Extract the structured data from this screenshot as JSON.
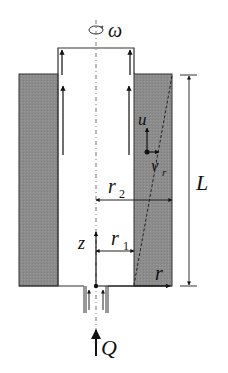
{
  "diagram": {
    "type": "schematic",
    "colors": {
      "wall_fill": "#8c8c8c",
      "line": "#222222",
      "background": "#ffffff"
    },
    "labels": {
      "omega": "ω",
      "u": "u",
      "v": "v",
      "v_sub": "r",
      "r2": "r",
      "r2_sub": "2",
      "r1": "r",
      "r1_sub": "1",
      "z": "z",
      "r_axis": "r",
      "L": "L",
      "Q": "Q"
    },
    "elements": [
      "rotation-indicator",
      "rotating-inner-cylinder",
      "left-outer-wall",
      "right-outer-wall",
      "centerline-axis",
      "axial-flow-arrows",
      "velocity-vectors-u-vr",
      "radius-r1-dimension",
      "radius-r2-dimension",
      "length-L-dimension",
      "z-axis",
      "r-axis",
      "inlet-pipe",
      "inflow-Q-arrow"
    ]
  }
}
